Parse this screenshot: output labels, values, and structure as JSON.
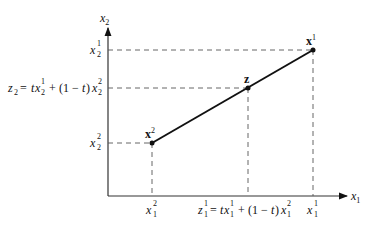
{
  "diagram": {
    "axes": {
      "x_axis_label": {
        "base": "x",
        "sub": "1"
      },
      "y_axis_label": {
        "base": "x",
        "sub": "2"
      }
    },
    "points": [
      {
        "id": "x1",
        "label": {
          "base": "x",
          "sup": "1"
        },
        "px": [
          313,
          50
        ]
      },
      {
        "id": "z",
        "label": {
          "base": "z"
        },
        "px": [
          248,
          88
        ]
      },
      {
        "id": "x2",
        "label": {
          "base": "x",
          "sup": "2"
        },
        "px": [
          152,
          143
        ]
      }
    ],
    "y_ticks": [
      {
        "id": "x2_1",
        "text": "x",
        "sub": "2",
        "sup": "1"
      },
      {
        "id": "z2",
        "formula": "z₂ = tx₂¹ + (1 − t) x₂²"
      },
      {
        "id": "x2_2",
        "text": "x",
        "sub": "2",
        "sup": "2"
      }
    ],
    "x_ticks": [
      {
        "id": "x1_2",
        "text": "x",
        "sub": "1",
        "sup": "2"
      },
      {
        "id": "z1",
        "formula": "z₁¹ = tx₁¹ + (1 − t) x₁²"
      },
      {
        "id": "x1_1",
        "text": "x",
        "sub": "1",
        "sup": "1"
      }
    ],
    "labels": {
      "x": "x",
      "z": "z",
      "t": "t",
      "one": "1",
      "two": "2",
      "eq": "=",
      "plus": "+",
      "open_paren": "(1 − ",
      "close_paren": ")",
      "z2_prefix": "z",
      "z1_prefix": "z"
    },
    "colors": {
      "line": "#111111",
      "dash": "#555555",
      "axis": "#333333"
    }
  }
}
